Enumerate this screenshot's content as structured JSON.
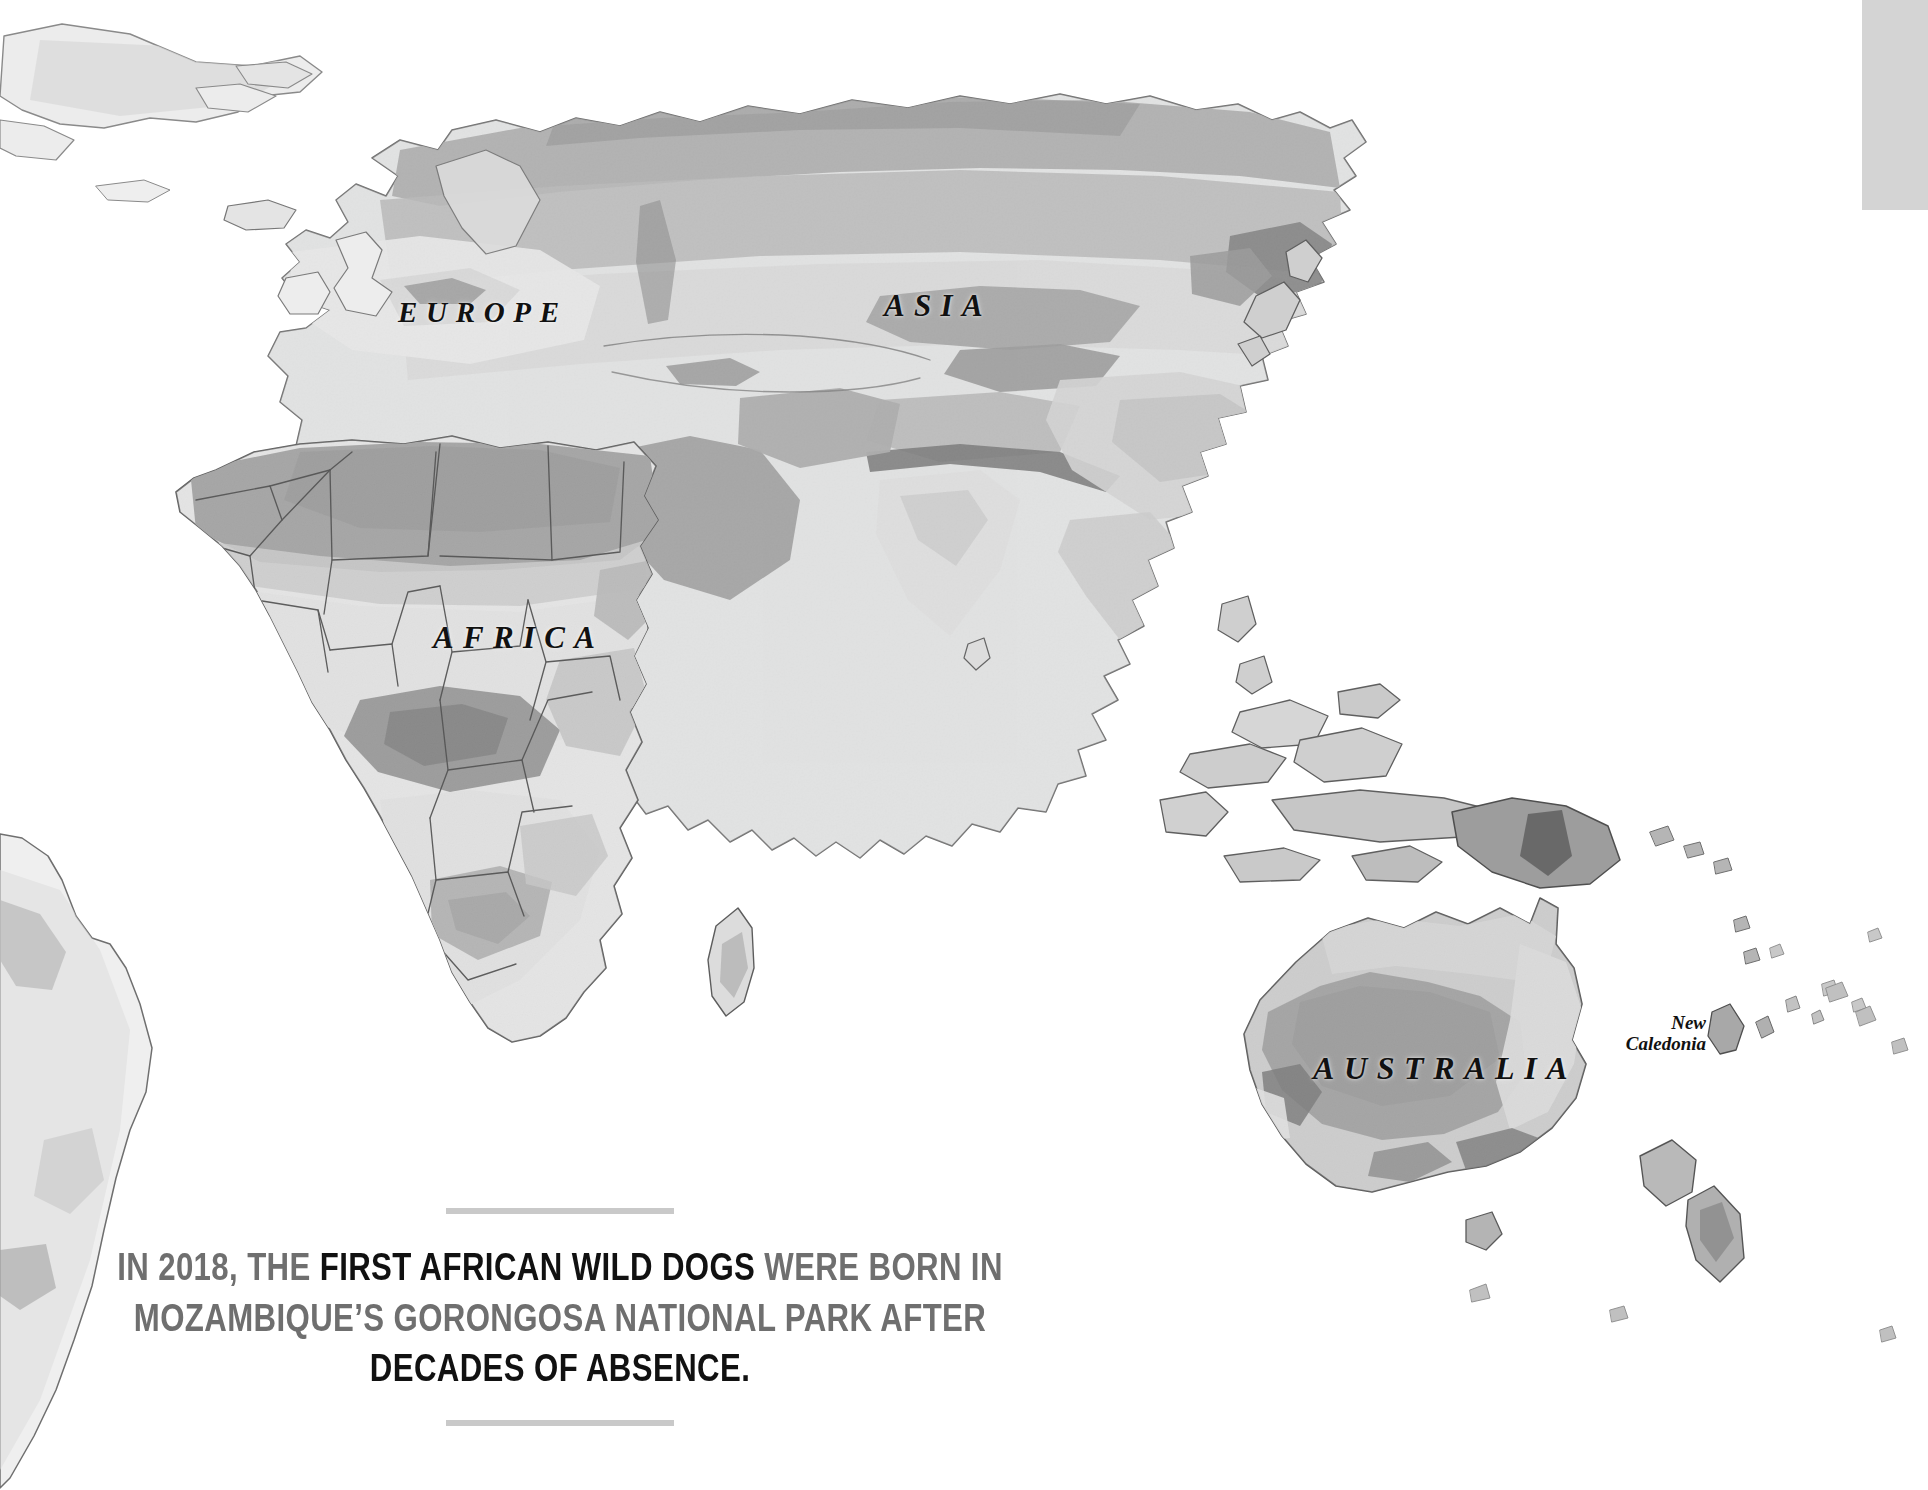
{
  "page": {
    "background_color": "#ffffff",
    "width": 1928,
    "height": 1490
  },
  "map": {
    "name": "world-map-grayscale",
    "projection": "equirectangular-crop",
    "ocean_color": "#ffffff",
    "land_base_color": "#eceded",
    "arid_color": "#9b9b9b",
    "mid_color": "#c3c3c3",
    "dark_color": "#6e6e6e",
    "border_color": "#4a4a4a",
    "coast_color": "#7a7a7a",
    "continent_labels": [
      {
        "id": "europe",
        "text": "EUROPE"
      },
      {
        "id": "asia",
        "text": "ASIA"
      },
      {
        "id": "africa",
        "text": "AFRICA"
      },
      {
        "id": "australia",
        "text": "AUSTRALIA"
      }
    ],
    "island_labels": [
      {
        "id": "new-caledonia",
        "line1": "New",
        "line2": "Caledonia"
      }
    ]
  },
  "caption": {
    "line1_pre": "IN 2018, THE ",
    "line1_highlight": "FIRST AFRICAN WILD DOGS",
    "line1_post": " WERE BORN IN",
    "line2": "MOZAMBIQUE’S GORONGOSA NATIONAL PARK AFTER",
    "line3": "DECADES OF ABSENCE.",
    "muted_color": "#6f6f6f",
    "highlight_color": "#111111",
    "rule_color": "#c9c9c9"
  },
  "corner_panel": {
    "color": "#d4d4d4"
  }
}
